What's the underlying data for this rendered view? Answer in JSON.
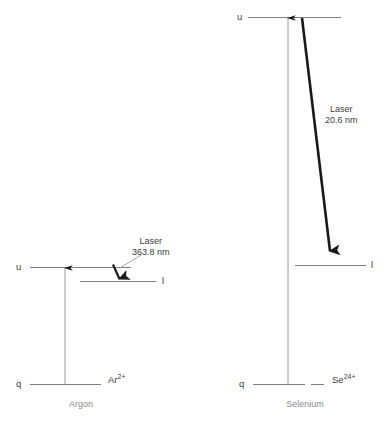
{
  "figure": {
    "title": "",
    "background_color": "#ffffff",
    "line_color": "#808080",
    "thick_arrow_color": "#1a1a1a",
    "text_color": "#3c3c3c",
    "element_label_color": "#8a8a8a"
  },
  "panels": [
    {
      "id": "argon",
      "element_name": "Argon",
      "ion_symbol": "Ar",
      "ion_charge": "2+",
      "laser_label": "Laser",
      "laser_wavelength": "363.8 nm",
      "levels": [
        {
          "name": "u",
          "label": "u"
        },
        {
          "name": "l",
          "label": "l"
        },
        {
          "name": "q",
          "label": "q"
        }
      ]
    },
    {
      "id": "selenium",
      "element_name": "Selenium",
      "ion_symbol": "Se",
      "ion_charge": "24+",
      "laser_label": "Laser",
      "laser_wavelength": "20.6 nm",
      "levels": [
        {
          "name": "u",
          "label": "u"
        },
        {
          "name": "l",
          "label": "l"
        },
        {
          "name": "q",
          "label": "q"
        }
      ]
    }
  ]
}
